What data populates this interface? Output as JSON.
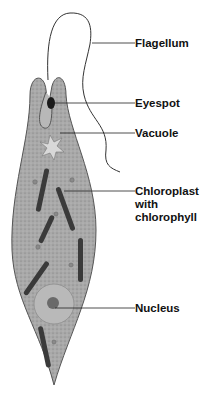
{
  "diagram": {
    "labels": [
      {
        "id": "flagellum",
        "text": "Flagellum"
      },
      {
        "id": "eyespot",
        "text": "Eyespot"
      },
      {
        "id": "vacuole",
        "text": "Vacuole"
      },
      {
        "id": "chloroplast",
        "text_line1": "Chloroplast",
        "text_line2": "with",
        "text_line3": "chlorophyll"
      },
      {
        "id": "nucleus",
        "text": "Nucleus"
      }
    ]
  }
}
